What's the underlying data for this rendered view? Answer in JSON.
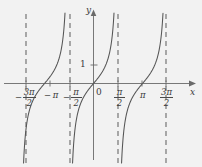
{
  "figure": {
    "title": "",
    "background_color": "#f2f2f2",
    "curve_color": "#555555",
    "axis_color": "#6a6a6a",
    "asymptote_color": "#6a6a6a",
    "label_color": "#3a3a3a"
  },
  "axis_labels": {
    "x": "x",
    "y": "y",
    "origin": "0",
    "y_tick_1": "1"
  },
  "x_tick_labels": [
    {
      "text": "-3π/2",
      "minus": "−",
      "numerator": "3π",
      "denominator": "2",
      "value": -4.712
    },
    {
      "text": "-π",
      "minus": "−",
      "numerator": "π",
      "denominator": "",
      "value": -3.1416
    },
    {
      "text": "-π/2",
      "minus": "−",
      "numerator": "π",
      "denominator": "2",
      "value": -1.5708
    },
    {
      "text": "π/2",
      "minus": "",
      "numerator": "π",
      "denominator": "2",
      "value": 1.5708
    },
    {
      "text": "π",
      "minus": "",
      "numerator": "π",
      "denominator": "",
      "value": 3.1416
    },
    {
      "text": "3π/2",
      "minus": "",
      "numerator": "3π",
      "denominator": "2",
      "value": 4.712
    }
  ],
  "chart_data": {
    "type": "line",
    "title": "",
    "xlabel": "x",
    "ylabel": "y",
    "function": "y = tan(x)",
    "xlim": [
      -5.5,
      5.7
    ],
    "ylim": [
      -4.8,
      4.6
    ],
    "grid": false,
    "legend": null,
    "x_ticks": [
      -4.712,
      -3.1416,
      -1.5708,
      0,
      1.5708,
      3.1416,
      4.712
    ],
    "x_tick_labels": [
      "−3π/2",
      "−π",
      "−π/2",
      "0",
      "π/2",
      "π",
      "3π/2"
    ],
    "y_ticks": [
      1
    ],
    "y_tick_labels": [
      "1"
    ],
    "asymptotes": [
      -4.712,
      -1.5708,
      1.5708,
      4.712
    ],
    "asymptote_style": "dashed",
    "branches": [
      {
        "domain": [
          -4.712,
          -1.5708
        ],
        "series": "tan"
      },
      {
        "domain": [
          -1.5708,
          1.5708
        ],
        "series": "tan"
      },
      {
        "domain": [
          1.5708,
          4.712
        ],
        "series": "tan"
      }
    ],
    "series": [
      {
        "name": "tan(x)",
        "x": [
          -4.6,
          -4.4,
          -4.2,
          -4.0,
          -3.8,
          -3.6,
          -3.4,
          -3.1416,
          -2.9,
          -2.7,
          -2.5,
          -2.3,
          -2.1,
          -1.9,
          -1.7,
          -1.45,
          -1.25,
          -1.05,
          -0.85,
          -0.6,
          -0.35,
          0.0,
          0.35,
          0.6,
          0.85,
          1.05,
          1.25,
          1.45,
          1.7,
          1.9,
          2.1,
          2.3,
          2.5,
          2.7,
          2.9,
          3.1416,
          3.4,
          3.6,
          3.8,
          4.0,
          4.2,
          4.4,
          4.6
        ],
        "y": [
          -8.86,
          -3.1,
          -1.77,
          -1.16,
          -0.77,
          -0.48,
          -0.26,
          0.0,
          0.26,
          0.48,
          0.75,
          1.12,
          1.71,
          2.93,
          7.7,
          -8.24,
          -3.01,
          -1.74,
          -1.14,
          -0.68,
          -0.37,
          0.0,
          0.37,
          0.68,
          1.14,
          1.74,
          3.01,
          8.24,
          -7.7,
          -2.93,
          -1.71,
          -1.12,
          -0.75,
          -0.48,
          -0.26,
          0.0,
          0.26,
          0.48,
          0.77,
          1.16,
          1.77,
          3.1,
          8.86
        ]
      }
    ]
  }
}
